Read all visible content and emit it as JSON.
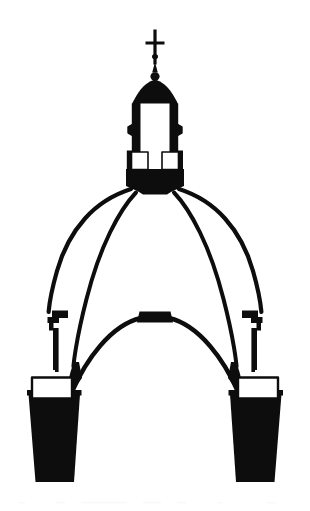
{
  "figure": {
    "title": "Cross-section of a double-shell masonry dome with lantern",
    "style": "black-and-white line engraving / silhouette",
    "background_color": "#ffffff",
    "ink_color": "#0d0d0d",
    "canvas": {
      "width": 310,
      "height": 511
    },
    "orientation": "vertical, bilaterally symmetric about the vertical center axis",
    "axis_of_symmetry_x": 155
  },
  "parts": [
    {
      "id": "cross-finial",
      "label": "Cross finial",
      "description": "Small latin cross crowning the lantern, with a knop on its shaft",
      "bbox": [
        145,
        29,
        22,
        37
      ]
    },
    {
      "id": "finial-ball",
      "label": "Gilt ball and spire",
      "description": "Tapering spire and sphere beneath the cross",
      "bbox": [
        148,
        63,
        16,
        20
      ]
    },
    {
      "id": "lantern-cupola",
      "label": "Lantern cupola",
      "description": "Small solid conical cap over the lantern",
      "bbox": [
        131,
        80,
        48,
        24
      ]
    },
    {
      "id": "lantern-body",
      "label": "Lantern",
      "description": "Tall octagonal lantern with flanking buttress piers and a hollow white interior",
      "bbox": [
        126,
        100,
        58,
        75
      ]
    },
    {
      "id": "lantern-window-left",
      "label": "Lantern opening (left)",
      "description": "White rectangular void at the lantern base, left side",
      "bbox": [
        131,
        152,
        17,
        18
      ]
    },
    {
      "id": "lantern-window-right",
      "label": "Lantern opening (right)",
      "description": "White rectangular void at the lantern base, right side",
      "bbox": [
        164,
        152,
        17,
        18
      ]
    },
    {
      "id": "oculus-drum",
      "label": "Oculus ring / lantern base",
      "description": "Heavy solid masonry ring on which the lantern stands, at the crown of the dome",
      "bbox": [
        126,
        168,
        58,
        26
      ]
    },
    {
      "id": "outer-shell",
      "label": "Outer shell",
      "description": "Pointed outer dome profile (quinto acuto), drawn as a single heavy curve from the oculus ring down to the stepped cornice",
      "side": "both"
    },
    {
      "id": "inner-shell",
      "label": "Inner shell",
      "description": "Second, steeper curve inside the outer shell, meeting it at the oculus; defines the hollow cavity between the two shells",
      "side": "both"
    },
    {
      "id": "cornice-left",
      "label": "Stepped cornice / gallery (left)",
      "description": "Small stepped corbel profile where the outer shell meets the drum, left haunch",
      "bbox": [
        47,
        310,
        22,
        60
      ]
    },
    {
      "id": "cornice-right",
      "label": "Stepped cornice / gallery (right)",
      "description": "Small stepped corbel profile where the outer shell meets the drum, right haunch",
      "bbox": [
        241,
        310,
        22,
        60
      ]
    },
    {
      "id": "inner-vault",
      "label": "Inner vault / intrados arch",
      "description": "Lower pointed arch forming the ceiling seen from inside the crossing",
      "bbox": [
        60,
        312,
        190,
        80
      ]
    },
    {
      "id": "vault-keystone",
      "label": "Keystone block",
      "description": "Solid rectangular block at the crown of the inner vault",
      "bbox": [
        140,
        312,
        34,
        11
      ]
    },
    {
      "id": "pier-left",
      "label": "Supporting pier (left)",
      "description": "Solid black tapering pier carrying the dome on the left",
      "bbox": [
        28,
        376,
        52,
        106
      ]
    },
    {
      "id": "pier-right",
      "label": "Supporting pier (right)",
      "description": "Solid black tapering pier carrying the dome on the right",
      "bbox": [
        230,
        376,
        52,
        106
      ]
    },
    {
      "id": "pier-window-left",
      "label": "Drum opening (left)",
      "description": "White rectangular window void at the head of the left pier",
      "bbox": [
        32,
        378,
        40,
        22
      ]
    },
    {
      "id": "pier-window-right",
      "label": "Drum opening (right)",
      "description": "White rectangular window void at the head of the right pier",
      "bbox": [
        238,
        378,
        40,
        22
      ]
    }
  ]
}
